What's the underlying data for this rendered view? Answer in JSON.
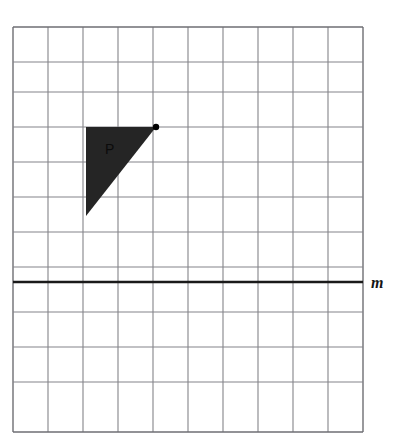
{
  "page": {
    "background_color": "#ffffff",
    "width": 399,
    "height": 448
  },
  "cropped_header": {
    "text": "",
    "note": "faint clipped text row at very top of image, illegible"
  },
  "grid": {
    "columns": 10,
    "rows": 11,
    "cell_size": 35,
    "origin_x": 13,
    "origin_y": 27,
    "line_color": "#848489",
    "border_color": "#6e6e73",
    "line_width": 1,
    "fill_color": "#ffffff"
  },
  "line_m": {
    "label": "m",
    "label_x": 378,
    "label_y": 288,
    "y": 282,
    "x_start": 13,
    "x_end": 363,
    "color": "#1a1a1a",
    "stroke_width": 2.4
  },
  "shape_p": {
    "label": "P",
    "label_x": 105,
    "label_y": 154,
    "type": "right-triangle",
    "fill_color": "#252525",
    "vertices": [
      {
        "x": 86,
        "y": 127
      },
      {
        "x": 156,
        "y": 127
      },
      {
        "x": 86,
        "y": 216
      }
    ],
    "vertex_marker": {
      "x": 156,
      "y": 127,
      "radius": 3.2,
      "color": "#000000"
    }
  }
}
